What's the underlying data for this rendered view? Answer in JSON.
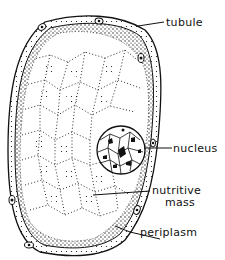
{
  "diagram": {
    "labels": [
      {
        "id": "tubule",
        "text": "tubule"
      },
      {
        "id": "nucleus",
        "text": "nucleus"
      },
      {
        "id": "nutritive_mass_line1",
        "text": "nutritive"
      },
      {
        "id": "nutritive_mass_line2",
        "text": "mass"
      },
      {
        "id": "periplasm",
        "text": "periplasm"
      }
    ],
    "colors": {
      "ink": "#111111",
      "background": "#ffffff"
    }
  }
}
